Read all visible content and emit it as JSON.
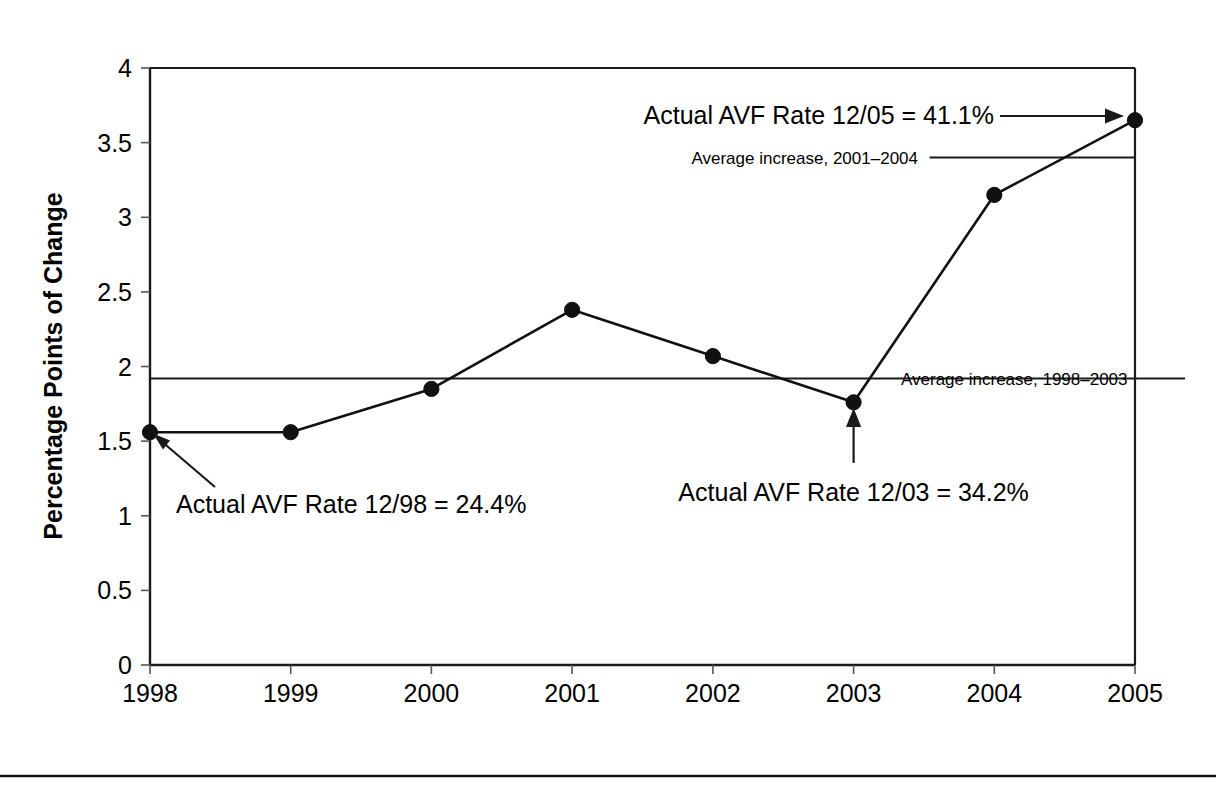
{
  "chart_data": {
    "type": "line",
    "title": "",
    "xlabel": "",
    "ylabel": "Percentage Points of Change",
    "categories": [
      "1998",
      "1999",
      "2000",
      "2001",
      "2002",
      "2003",
      "2004",
      "2005"
    ],
    "values": [
      1.56,
      1.56,
      1.85,
      2.38,
      2.07,
      1.76,
      3.15,
      3.65
    ],
    "series": [
      {
        "name": "Percentage points of change",
        "values": [
          1.56,
          1.56,
          1.85,
          2.38,
          2.07,
          1.76,
          3.15,
          3.65
        ]
      }
    ],
    "ylim": [
      0,
      4
    ],
    "ytick_labels": [
      "0",
      "0.5",
      "1",
      "1.5",
      "2",
      "2.5",
      "3",
      "3.5",
      "4"
    ],
    "ytick_values": [
      0,
      0.5,
      1,
      1.5,
      2,
      2.5,
      3,
      3.5,
      4
    ],
    "grid": false,
    "legend": "none",
    "reference_lines": [
      {
        "name": "average-increase-1998-2003",
        "label": "Average increase, 1998–2003",
        "value": 1.92,
        "x_start_category": "1998",
        "x_end_category": "2005"
      },
      {
        "name": "average-increase-2001-2004",
        "label": "Average increase, 2001–2004",
        "value": 3.4,
        "x_start_category": "2003",
        "x_end_category": "2005"
      }
    ],
    "annotations": [
      {
        "name": "callout-1998",
        "text": "Actual AVF Rate 12/98 = 24.4%",
        "target_category": "1998",
        "target_value": 1.56
      },
      {
        "name": "callout-2003",
        "text": "Actual AVF Rate 12/03 = 34.2%",
        "target_category": "2003",
        "target_value": 1.76
      },
      {
        "name": "callout-2005",
        "text": "Actual AVF Rate 12/05 = 41.1%",
        "target_category": "2005",
        "target_value": 3.65
      }
    ],
    "colors": {
      "line": "#111111",
      "marker": "#111111",
      "axis": "#1a1a1a",
      "text": "#000000",
      "background": "#ffffff"
    }
  }
}
